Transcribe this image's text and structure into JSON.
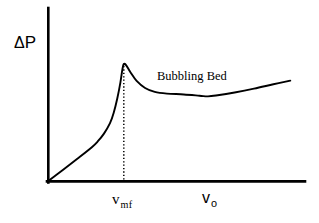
{
  "chart_data": {
    "type": "line",
    "title": "",
    "subtitle": "",
    "xlabel": "v o",
    "ylabel": "ΔP",
    "grid": false,
    "legend": null,
    "axis_labels": {
      "y_main": "Δ",
      "y_sub_main": "P",
      "x_tick_symbol": "v",
      "x_tick_subscript": "mf",
      "x_axis_symbol": "v",
      "x_axis_subscript": "o"
    },
    "annotations": [
      {
        "text": "Bubbling Bed",
        "x_frac": 0.45,
        "y_frac": 0.55
      }
    ],
    "reference_lines": [
      {
        "name": "v_mf",
        "orientation": "vertical",
        "style": "dotted",
        "x_frac": 0.312
      }
    ],
    "axis_ranges": {
      "x": [
        0,
        1
      ],
      "y": [
        0,
        1
      ]
    },
    "series": [
      {
        "name": "pressure-drop",
        "style": "solid",
        "color": "#000000",
        "description": "Pressure drop across a packed/fluidized bed versus superficial gas velocity: linear rise through the fixed-bed regime, overshoot peak at minimum fluidization velocity, relaxation to a near-constant bubbling-bed plateau with a slight rise at high velocity.",
        "points": [
          {
            "x": 0.0,
            "y": 0.0
          },
          {
            "x": 0.06,
            "y": 0.078
          },
          {
            "x": 0.12,
            "y": 0.158
          },
          {
            "x": 0.18,
            "y": 0.24
          },
          {
            "x": 0.205,
            "y": 0.282
          },
          {
            "x": 0.23,
            "y": 0.336
          },
          {
            "x": 0.255,
            "y": 0.41
          },
          {
            "x": 0.27,
            "y": 0.482
          },
          {
            "x": 0.285,
            "y": 0.585
          },
          {
            "x": 0.298,
            "y": 0.7
          },
          {
            "x": 0.306,
            "y": 0.79
          },
          {
            "x": 0.312,
            "y": 0.83
          },
          {
            "x": 0.322,
            "y": 0.82
          },
          {
            "x": 0.34,
            "y": 0.77
          },
          {
            "x": 0.365,
            "y": 0.71
          },
          {
            "x": 0.4,
            "y": 0.66
          },
          {
            "x": 0.44,
            "y": 0.632
          },
          {
            "x": 0.49,
            "y": 0.62
          },
          {
            "x": 0.56,
            "y": 0.614
          },
          {
            "x": 0.625,
            "y": 0.605
          },
          {
            "x": 0.66,
            "y": 0.6
          },
          {
            "x": 0.7,
            "y": 0.608
          },
          {
            "x": 0.77,
            "y": 0.628
          },
          {
            "x": 0.85,
            "y": 0.655
          },
          {
            "x": 0.93,
            "y": 0.686
          },
          {
            "x": 1.0,
            "y": 0.712
          }
        ]
      }
    ]
  },
  "figure": {
    "background_color": "#ffffff",
    "ink_color": "#000000"
  }
}
